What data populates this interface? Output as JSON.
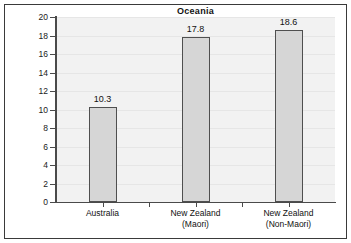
{
  "chart_data": {
    "type": "bar",
    "title": "Oceania",
    "xlabel": "",
    "ylabel": "Annual rates per million children 0-4 yrs",
    "categories": [
      "Australia",
      "New Zealand (Maori)",
      "New Zealand (Non-Maori)"
    ],
    "category_lines": [
      [
        "Australia"
      ],
      [
        "New Zealand",
        "(Maori)"
      ],
      [
        "New Zealand",
        "(Non-Maori)"
      ]
    ],
    "values": [
      10.3,
      17.8,
      18.6
    ],
    "value_labels": [
      "10.3",
      "17.8",
      "18.6"
    ],
    "ylim": [
      0,
      20
    ],
    "ytick_values": [
      0,
      2,
      4,
      6,
      8,
      10,
      12,
      14,
      16,
      18,
      20
    ],
    "ytick_labels": [
      "0",
      "2",
      "4",
      "6",
      "8",
      "10",
      "12",
      "14",
      "16",
      "18",
      "20"
    ],
    "grid": true,
    "legend": null,
    "colors": {
      "bar_fill": "#d6d6d6",
      "bar_border": "#4f4f4f",
      "plot_background": "#f2f2f2",
      "axis": "#4a4a4a",
      "frame": "#3a3a3a",
      "text": "#111111",
      "gridline": "#e6e6e6"
    }
  }
}
